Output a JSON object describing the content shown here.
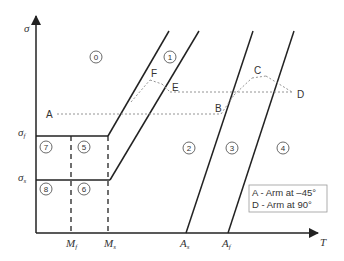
{
  "diagram": {
    "type": "phase-diagram",
    "axes": {
      "y_label": "σ",
      "x_label": "T",
      "y_ticks": [
        {
          "label": "σ",
          "sub": "f"
        },
        {
          "label": "σ",
          "sub": "s"
        }
      ],
      "x_ticks": [
        {
          "label": "M",
          "sub": "f"
        },
        {
          "label": "M",
          "sub": "s"
        },
        {
          "label": "A",
          "sub": "s"
        },
        {
          "label": "A",
          "sub": "f"
        }
      ]
    },
    "regions": [
      "0",
      "1",
      "2",
      "3",
      "4",
      "5",
      "6",
      "7",
      "8"
    ],
    "points": {
      "A": "A",
      "B": "B",
      "C": "C",
      "D": "D",
      "E": "E",
      "F": "F"
    },
    "legend": [
      "A - Arm at –45°",
      "D - Arm at 90°"
    ],
    "colors": {
      "line": "#222222",
      "path": "#888888",
      "text": "#333333"
    }
  }
}
